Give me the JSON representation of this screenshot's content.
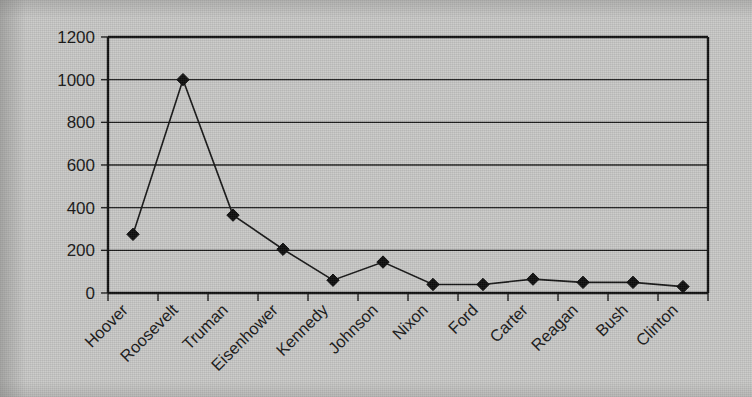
{
  "chart_data": {
    "type": "line",
    "title": "",
    "subtitle": "",
    "xlabel": "",
    "ylabel": "",
    "categories": [
      "Hoover",
      "Roosevelt",
      "Truman",
      "Eisenhower",
      "Kennedy",
      "Johnson",
      "Nixon",
      "Ford",
      "Carter",
      "Reagan",
      "Bush",
      "Clinton"
    ],
    "values": [
      275,
      1000,
      365,
      205,
      60,
      145,
      40,
      40,
      65,
      50,
      50,
      30
    ],
    "series": [
      {
        "name": "",
        "values": [
          275,
          1000,
          365,
          205,
          60,
          145,
          40,
          40,
          65,
          50,
          50,
          30
        ]
      }
    ],
    "ylim": [
      0,
      1200
    ],
    "yticks": [
      0,
      200,
      400,
      600,
      800,
      1000,
      1200
    ],
    "ytick_labels": [
      "0",
      "200",
      "400",
      "600",
      "800",
      "1000",
      "1200"
    ],
    "xtick_labels": [
      "Hoover",
      "Roosevelt",
      "Truman",
      "Eisenhower",
      "Kennedy",
      "Johnson",
      "Nixon",
      "Ford",
      "Carter",
      "Reagan",
      "Bush",
      "Clinton"
    ],
    "xtick_label_rotation": -45,
    "grid": true,
    "grid_axis": "y",
    "legend": false,
    "legend_position": "none",
    "marker": "diamond",
    "line_color": "#161616",
    "marker_color": "#0d0d0d",
    "grid_color": "#1c1c1c",
    "axis_color": "#101010",
    "background_color": "#c9c9c7",
    "plot_background_color": "#c9c9c7"
  }
}
